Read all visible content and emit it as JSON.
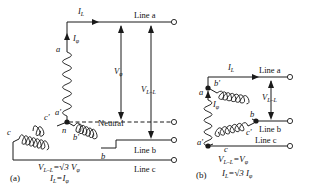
{
  "figure": {
    "background": "#ffffff",
    "ink": "#1a1a1a"
  },
  "diagram_a": {
    "caption": "(a)",
    "type": "wye",
    "currents": {
      "line": "I",
      "line_sub": "L",
      "phase": "I",
      "phase_sub": "φ"
    },
    "voltages": {
      "phase": "V",
      "phase_sub": "φ",
      "line_to_line": "V",
      "line_to_line_sub": "L–L"
    },
    "winding_labels": [
      "a",
      "a'",
      "b",
      "b'",
      "c",
      "c'",
      "n"
    ],
    "terminals": [
      {
        "label": "Line a"
      },
      {
        "label": "Neutral"
      },
      {
        "label": "Line b"
      },
      {
        "label": "Line c"
      }
    ],
    "equations": [
      {
        "lhs": "V",
        "lhs_sub": "L–L",
        "rel": "=",
        "rhs": "√3 V",
        "rhs_sub": "φ"
      },
      {
        "lhs": "I",
        "lhs_sub": "L",
        "rel": "=",
        "rhs": "I",
        "rhs_sub": "φ"
      }
    ]
  },
  "diagram_b": {
    "caption": "(b)",
    "type": "delta",
    "currents": {
      "line": "I",
      "line_sub": "L",
      "phase": "I",
      "phase_sub": "φ"
    },
    "voltages": {
      "line_to_line": "V",
      "line_to_line_sub": "L–L"
    },
    "winding_labels": [
      "a",
      "a'",
      "b",
      "b'",
      "c",
      "c'"
    ],
    "terminals": [
      {
        "label": "Line a"
      },
      {
        "label": "Line b"
      },
      {
        "label": "Line c"
      }
    ],
    "equations": [
      {
        "lhs": "V",
        "lhs_sub": "L–L",
        "rel": "=",
        "rhs": "V",
        "rhs_sub": "φ"
      },
      {
        "lhs": "I",
        "lhs_sub": "L",
        "rel": "=",
        "rhs": "√3 I",
        "rhs_sub": "φ"
      }
    ]
  }
}
